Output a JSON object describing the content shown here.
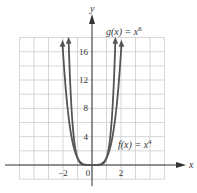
{
  "chart_data": {
    "type": "line",
    "title": "",
    "xlabel": "x",
    "ylabel": "y",
    "xlim": [
      -5,
      5
    ],
    "ylim": [
      -2,
      18
    ],
    "grid": true,
    "x_tick_labels": [
      "-2",
      "0",
      "2"
    ],
    "y_tick_labels": [
      "4",
      "8",
      "12",
      "16"
    ],
    "series": [
      {
        "name": "f(x) = x^4",
        "label_text": "f(x) = x",
        "label_exponent": "4",
        "x": [
          -2.03,
          -1.5,
          -1,
          -0.5,
          0,
          0.5,
          1,
          1.5,
          2.03
        ],
        "y": [
          17.0,
          5.06,
          1,
          0.06,
          0,
          0.06,
          1,
          5.06,
          17.0
        ]
      },
      {
        "name": "g(x) = x^6",
        "label_text": "g(x) = x",
        "label_exponent": "6",
        "x": [
          -1.61,
          -1.25,
          -1,
          -0.5,
          0,
          0.5,
          1,
          1.25,
          1.61
        ],
        "y": [
          17.4,
          3.81,
          1,
          0.02,
          0,
          0.02,
          1,
          3.81,
          17.4
        ]
      }
    ]
  },
  "colors": {
    "curve": "#555555",
    "axis": "#333333",
    "grid": "#cccccc"
  },
  "axes": {
    "x_label": "x",
    "y_label": "y",
    "origin_label": "0"
  }
}
